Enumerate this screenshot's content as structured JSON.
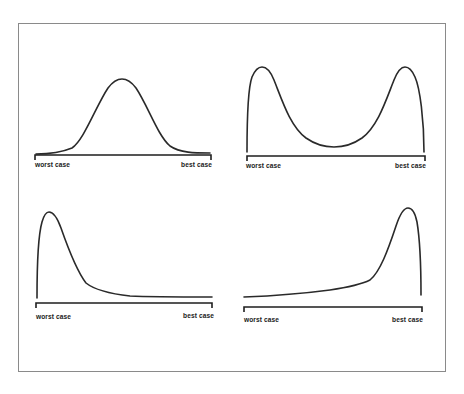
{
  "figure": {
    "frame_color": "#8a8a8a",
    "curve_color": "#2a2a2a",
    "panels": [
      {
        "id": "normal",
        "shape": "symmetric bell curve (normal distribution)",
        "axis_left_label": "worst case",
        "axis_right_label": "best case"
      },
      {
        "id": "bimodal",
        "shape": "U-shaped bimodal distribution with peaks at both extremes",
        "axis_left_label": "worst case",
        "axis_right_label": "best case"
      },
      {
        "id": "right-skewed",
        "shape": "peak near worst case with long tail toward best case",
        "axis_left_label": "worst case",
        "axis_right_label": "best case"
      },
      {
        "id": "left-skewed",
        "shape": "long flat tail from worst case rising to peak near best case",
        "axis_left_label": "worst case",
        "axis_right_label": "best case"
      }
    ]
  }
}
